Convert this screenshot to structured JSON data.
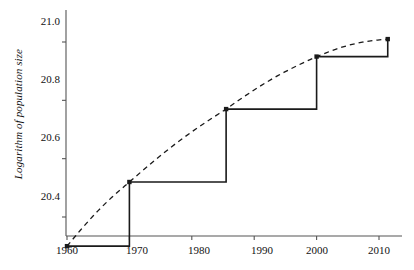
{
  "chart_data": {
    "type": "line",
    "title": "",
    "xlabel": "",
    "ylabel": "Logarithm of population size",
    "xlim": [
      1957,
      2014
    ],
    "ylim": [
      20.29,
      21.06
    ],
    "grid": false,
    "legend": null,
    "xticks": [
      1960,
      1970,
      1980,
      1990,
      2000,
      2010
    ],
    "xtick_labels": [
      "1960",
      "1970",
      "1980",
      "1990",
      "2000",
      "2010"
    ],
    "yticks": [
      20.4,
      20.6,
      20.8,
      21.0
    ],
    "ytick_labels": [
      "20.4",
      "20.6",
      "20.8",
      "21.0"
    ],
    "series": [
      {
        "name": "census-step",
        "style": "solid-step",
        "color": "#1a1a1a",
        "x": [
          1960,
          1970,
          1985.5,
          2000,
          2011.4
        ],
        "values": [
          20.3,
          20.52,
          20.77,
          20.95,
          21.01
        ]
      },
      {
        "name": "interpolated-trend",
        "style": "dashed",
        "color": "#1a1a1a",
        "x": [
          1960,
          1970,
          1985.5,
          2000,
          2011.4
        ],
        "values": [
          20.3,
          20.52,
          20.77,
          20.95,
          21.01
        ]
      }
    ],
    "markers": [
      {
        "x": 1960,
        "y": 20.3
      },
      {
        "x": 1970,
        "y": 20.52
      },
      {
        "x": 1985.5,
        "y": 20.77
      },
      {
        "x": 2000,
        "y": 20.95
      },
      {
        "x": 2011.4,
        "y": 21.01
      }
    ]
  },
  "axis": {
    "ylabel_text": "Logarithm of population size"
  },
  "colors": {
    "axis": "#555555",
    "line": "#1a1a1a",
    "background": "#ffffff"
  }
}
